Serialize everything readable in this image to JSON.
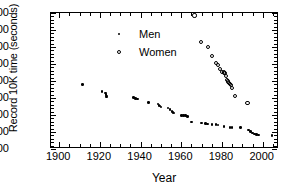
{
  "chart_data": {
    "type": "scatter",
    "title": "",
    "xlabel": "Year",
    "ylabel": "Record 10K time (seconds)",
    "xlim": [
      1896,
      2008
    ],
    "ylim": [
      1500,
      2300
    ],
    "xticks": [
      1900,
      1920,
      1940,
      1960,
      1980,
      2000
    ],
    "yticks": [
      1500,
      1600,
      1700,
      1800,
      1900,
      2000,
      2100,
      2200,
      2300
    ],
    "x_minor_tick_step": 5,
    "y_minor_tick_step": 20,
    "grid": false,
    "legend_position": "upper-left-inside",
    "series": [
      {
        "name": "Men",
        "marker": "filled-circle",
        "color": "#000000",
        "points": [
          [
            1911.5,
            1880
          ],
          [
            1921.0,
            1838
          ],
          [
            1922.8,
            1830
          ],
          [
            1923.0,
            1822
          ],
          [
            1923.2,
            1812
          ],
          [
            1923.4,
            1806
          ],
          [
            1936.5,
            1802
          ],
          [
            1937.5,
            1797
          ],
          [
            1938.5,
            1793
          ],
          [
            1944.0,
            1775
          ],
          [
            1948.5,
            1765
          ],
          [
            1949.0,
            1757
          ],
          [
            1949.5,
            1752
          ],
          [
            1950.0,
            1748
          ],
          [
            1953.5,
            1741
          ],
          [
            1954.5,
            1732
          ],
          [
            1955.5,
            1722
          ],
          [
            1956.0,
            1714
          ],
          [
            1956.5,
            1712
          ],
          [
            1960.0,
            1698
          ],
          [
            1961.0,
            1697
          ],
          [
            1962.0,
            1696
          ],
          [
            1963.0,
            1690
          ],
          [
            1965.0,
            1659
          ],
          [
            1970.0,
            1653
          ],
          [
            1972.0,
            1650
          ],
          [
            1973.0,
            1648
          ],
          [
            1975.0,
            1644
          ],
          [
            1977.0,
            1643
          ],
          [
            1978.0,
            1642
          ],
          [
            1981.0,
            1634
          ],
          [
            1984.0,
            1628
          ],
          [
            1985.0,
            1627
          ],
          [
            1989.0,
            1625
          ],
          [
            1993.0,
            1612
          ],
          [
            1994.0,
            1602
          ],
          [
            1995.0,
            1594
          ],
          [
            1996.0,
            1589
          ],
          [
            1997.0,
            1586
          ],
          [
            1998.0,
            1582
          ],
          [
            2004.5,
            1578
          ]
        ]
      },
      {
        "name": "Women",
        "marker": "open-circle",
        "color": "#000000",
        "points": [
          [
            1966.5,
            2285
          ],
          [
            1969.5,
            2130
          ],
          [
            1973.0,
            2100
          ],
          [
            1975.0,
            2048
          ],
          [
            1977.0,
            2005
          ],
          [
            1978.0,
            1992
          ],
          [
            1979.0,
            1972
          ],
          [
            1980.0,
            1955
          ],
          [
            1981.0,
            1950
          ],
          [
            1981.5,
            1948
          ],
          [
            1982.0,
            1930
          ],
          [
            1982.5,
            1905
          ],
          [
            1983.0,
            1897
          ],
          [
            1983.5,
            1890
          ],
          [
            1984.0,
            1884
          ],
          [
            1984.5,
            1878
          ],
          [
            1985.0,
            1860
          ],
          [
            1986.5,
            1812
          ],
          [
            1992.5,
            1770
          ]
        ]
      }
    ]
  },
  "legend": {
    "entries": [
      {
        "label": "Men",
        "symbol": "filled-circle"
      },
      {
        "label": "Women",
        "symbol": "open-circle"
      }
    ]
  }
}
